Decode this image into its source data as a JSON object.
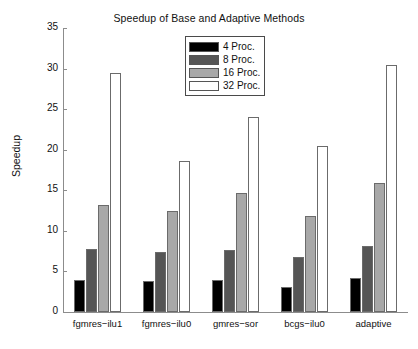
{
  "chart_data": {
    "type": "bar",
    "title": "Speedup of Base and Adaptive Methods",
    "xlabel": "",
    "ylabel": "Speedup",
    "ylim": [
      0,
      35
    ],
    "yticks": [
      0,
      5,
      10,
      15,
      20,
      25,
      30,
      35
    ],
    "grid": false,
    "legend_position": "top-center",
    "categories": [
      "fgmres−ilu1",
      "fgmres−ilu0",
      "gmres−sor",
      "bcgs−ilu0",
      "adaptive"
    ],
    "series": [
      {
        "name": "4 Proc.",
        "color": "#000000",
        "values": [
          3.9,
          3.8,
          3.9,
          3.1,
          4.2
        ]
      },
      {
        "name": "8 Proc.",
        "color": "#555555",
        "values": [
          7.8,
          7.4,
          7.7,
          6.8,
          8.1
        ]
      },
      {
        "name": "16 Proc.",
        "color": "#a8a8a8",
        "values": [
          13.2,
          12.5,
          14.7,
          11.8,
          15.9
        ]
      },
      {
        "name": "32 Proc.",
        "color": "#ffffff",
        "values": [
          29.4,
          18.6,
          24.0,
          20.5,
          30.5
        ]
      }
    ]
  },
  "legend": {
    "items": [
      {
        "label": "4 Proc."
      },
      {
        "label": "8 Proc."
      },
      {
        "label": "16 Proc."
      },
      {
        "label": "32 Proc."
      }
    ]
  }
}
